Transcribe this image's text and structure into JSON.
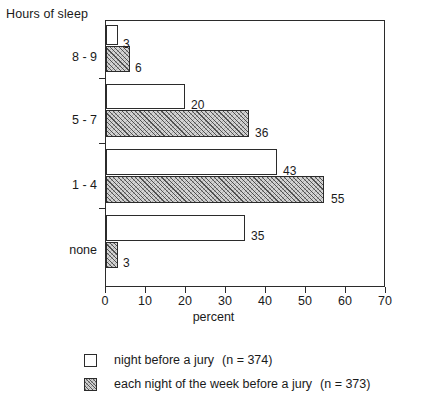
{
  "chart_data": {
    "type": "bar",
    "orientation": "horizontal",
    "title": "",
    "xlabel": "percent",
    "ylabel": "Hours of sleep",
    "xlim": [
      0,
      70
    ],
    "xticks": [
      0,
      10,
      20,
      30,
      40,
      50,
      60,
      70
    ],
    "grid": false,
    "legend_position": "bottom",
    "categories": [
      "8 - 9",
      "5 - 7",
      "1 - 4",
      "none"
    ],
    "series": [
      {
        "name": "night before a jury",
        "n_label": "(n = 374)",
        "style": "open",
        "values": [
          3,
          20,
          43,
          35
        ]
      },
      {
        "name": "each night of the week before a jury",
        "n_label": "(n = 373)",
        "style": "hatched",
        "values": [
          6,
          36,
          55,
          3
        ]
      }
    ],
    "value_labels": {
      "8 - 9": [
        "3",
        "6"
      ],
      "5 - 7": [
        "20",
        "36"
      ],
      "1 - 4": [
        "43",
        "55"
      ],
      "none": [
        "35",
        "3"
      ]
    }
  },
  "axes": {
    "y_title": "Hours of sleep",
    "x_title": "percent",
    "x_tick_labels": [
      "0",
      "10",
      "20",
      "30",
      "40",
      "50",
      "60",
      "70"
    ],
    "category_labels": [
      "8 - 9",
      "5 - 7",
      "1 - 4",
      "none"
    ]
  },
  "bars": [
    {
      "value_label": "3",
      "group": "8 - 9",
      "style": "open"
    },
    {
      "value_label": "6",
      "group": "8 - 9",
      "style": "hatched"
    },
    {
      "value_label": "20",
      "group": "5 - 7",
      "style": "open"
    },
    {
      "value_label": "36",
      "group": "5 - 7",
      "style": "hatched"
    },
    {
      "value_label": "43",
      "group": "1 - 4",
      "style": "open"
    },
    {
      "value_label": "55",
      "group": "1 - 4",
      "style": "hatched"
    },
    {
      "value_label": "35",
      "group": "none",
      "style": "open"
    },
    {
      "value_label": "3",
      "group": "none",
      "style": "hatched"
    }
  ],
  "legend": {
    "items": [
      {
        "label": "night before a jury",
        "n": "(n = 374)",
        "swatch": "open-square-icon"
      },
      {
        "label": "each night of the week before a jury",
        "n": "(n = 373)",
        "swatch": "hatched-square-icon"
      }
    ]
  },
  "colors": {
    "ink": "#1a1a1a",
    "axis": "#2b2b2b",
    "bar_open_fill": "#ffffff",
    "bar_hatched_fill": "#d3d3d3",
    "background": "#ffffff"
  }
}
